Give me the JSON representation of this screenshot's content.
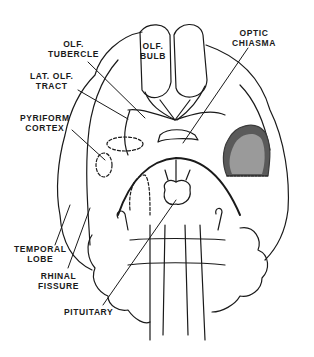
{
  "figure": {
    "labels": {
      "olf_tubercle": [
        "OLF.",
        "TUBERCLE"
      ],
      "olf_bulb": [
        "OLF.",
        "BULB"
      ],
      "optic_chiasma": [
        "OPTIC",
        "CHIASMA"
      ],
      "lat_olf_tract": [
        "LAT. OLF.",
        "TRACT"
      ],
      "pyriform_cortex": [
        "PYRIFORM",
        "CORTEX"
      ],
      "temporal_lobe": [
        "TEMPORAL",
        "LOBE"
      ],
      "rhinal_fissure": [
        "RHINAL",
        "FISSURE"
      ],
      "pituitary": [
        "PITUITARY"
      ]
    },
    "colors": {
      "line": "#1a1a1a",
      "lesion_outer": "#5a5a5a",
      "lesion_inner": "#9a9a9a",
      "background": "#ffffff"
    }
  }
}
